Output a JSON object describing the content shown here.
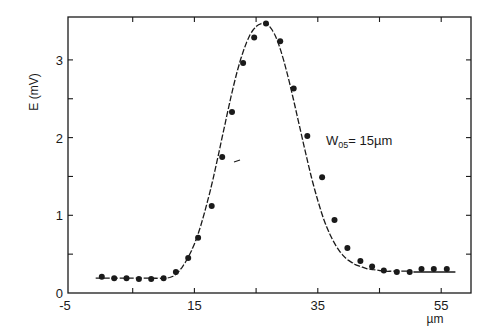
{
  "chart_data": {
    "type": "scatter",
    "title": "",
    "xlabel": "µm",
    "ylabel": "E (mV)",
    "xlim": [
      -5,
      60
    ],
    "ylim": [
      0,
      3.55
    ],
    "xticks": [
      -5,
      5,
      15,
      25,
      35,
      45,
      55
    ],
    "xtick_labels": [
      "-5",
      "",
      "15",
      "",
      "35",
      "",
      "55"
    ],
    "yticks": [
      0,
      0.5,
      1,
      1.5,
      2,
      2.5,
      3
    ],
    "ytick_labels": [
      "0",
      "",
      "1",
      "",
      "2",
      "",
      "3"
    ],
    "grid": false,
    "legend": null,
    "annotation": {
      "text_main": "W",
      "text_sub": "05",
      "text_rest": "= 15µm",
      "x": 35.5,
      "y": 1.9
    },
    "series": [
      {
        "name": "measured",
        "style": "markers",
        "x": [
          0,
          2,
          4,
          6,
          8,
          10,
          12,
          14,
          15.6,
          17.8,
          19.5,
          21.1,
          22.9,
          24.7,
          26.6,
          28.9,
          31.1,
          33.3,
          35.7,
          37.7,
          39.8,
          41.9,
          43.8,
          45.7,
          47.8,
          49.9,
          51.8,
          53.8,
          55.9
        ],
        "y": [
          0.21,
          0.19,
          0.19,
          0.18,
          0.18,
          0.19,
          0.27,
          0.45,
          0.71,
          1.12,
          1.75,
          2.33,
          2.96,
          3.29,
          3.47,
          3.24,
          2.63,
          2.02,
          1.49,
          0.94,
          0.58,
          0.41,
          0.34,
          0.29,
          0.27,
          0.27,
          0.31,
          0.31,
          0.31
        ]
      },
      {
        "name": "fit",
        "style": "line",
        "x": [
          -1,
          0,
          2,
          4,
          6,
          8,
          10,
          11,
          12,
          13,
          14,
          15,
          16,
          17,
          18,
          19,
          20,
          21,
          22,
          23,
          24,
          25,
          26,
          26.6,
          27,
          28,
          29,
          30,
          31,
          32,
          33,
          34,
          35,
          36,
          37,
          38,
          39,
          40,
          41,
          42,
          43,
          44,
          45,
          46,
          47,
          48,
          49,
          50
        ],
        "y": [
          0.19,
          0.19,
          0.19,
          0.19,
          0.19,
          0.19,
          0.19,
          0.2,
          0.24,
          0.33,
          0.46,
          0.63,
          0.86,
          1.14,
          1.46,
          1.82,
          2.19,
          2.55,
          2.87,
          3.13,
          3.32,
          3.43,
          3.47,
          3.47,
          3.45,
          3.33,
          3.12,
          2.84,
          2.51,
          2.16,
          1.81,
          1.48,
          1.19,
          0.94,
          0.75,
          0.6,
          0.49,
          0.42,
          0.37,
          0.34,
          0.31,
          0.3,
          0.29,
          0.28,
          0.28,
          0.28,
          0.28,
          0.28
        ]
      },
      {
        "name": "baseline-right",
        "style": "line",
        "x": [
          50.5,
          57.3
        ],
        "y": [
          0.27,
          0.27
        ]
      }
    ]
  },
  "labels": {
    "y_axis": "E (mV)",
    "x_axis": "µm",
    "annotation_main": "W",
    "annotation_sub": "05",
    "annotation_rest": "= 15µm"
  }
}
